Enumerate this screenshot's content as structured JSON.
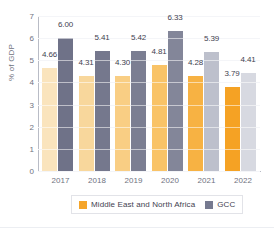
{
  "chart_data": {
    "type": "bar",
    "title": "",
    "subtitle": "",
    "xlabel": "",
    "ylabel": "% of GDP",
    "categories": [
      "2017",
      "2018",
      "2019",
      "2020",
      "2021",
      "2022"
    ],
    "series": [
      {
        "name": "Middle East and North Africa",
        "values": [
          4.66,
          4.31,
          4.3,
          4.81,
          4.28,
          3.79
        ],
        "labels": [
          "4.66",
          "4.31",
          "4.30",
          "4.81",
          "4.28",
          "3.79"
        ],
        "colors": [
          "#FAE4BD",
          "#F8D79C",
          "#F9CE84",
          "#F9C367",
          "#F7B243",
          "#F5A224"
        ]
      },
      {
        "name": "GCC",
        "values": [
          6.0,
          5.41,
          5.42,
          6.33,
          5.39,
          4.41
        ],
        "labels": [
          "6.00",
          "5.41",
          "5.42",
          "6.33",
          "5.39",
          "4.41"
        ],
        "colors": [
          "#6F7288",
          "#75788D",
          "#7B7E92",
          "#838699",
          "#BDC0CC",
          "#D7D9E1"
        ]
      }
    ],
    "ylim": [
      0,
      7
    ],
    "yticks": [
      "0",
      "1",
      "2",
      "3",
      "4",
      "5",
      "6",
      "7"
    ],
    "grid": true,
    "legend_position": "bottom",
    "legend": [
      {
        "label": "Middle East and North Africa",
        "color": "#F5A52A"
      },
      {
        "label": "GCC",
        "color": "#767A90"
      }
    ]
  }
}
